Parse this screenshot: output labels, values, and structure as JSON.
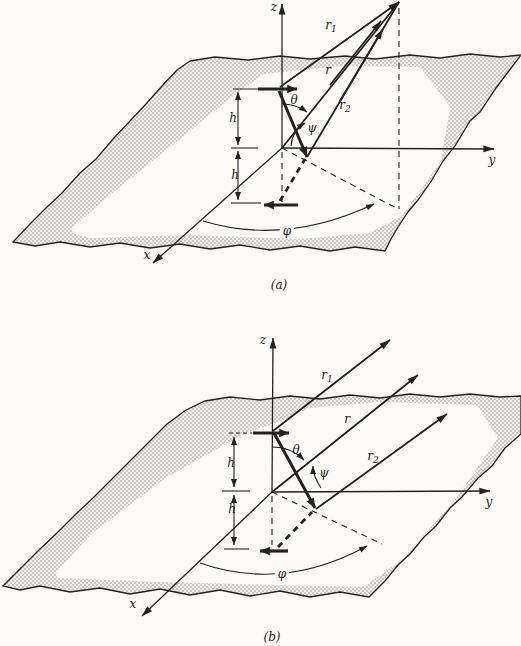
{
  "colors": {
    "ink": "#222222",
    "paper": "#fcfbf8",
    "stipple_bg": "#f1f0ec",
    "stipple_dot": "#9b9b97"
  },
  "panels": [
    {
      "caption": "(a)",
      "axes": {
        "x": "x",
        "y": "y",
        "z": "z"
      },
      "rays": {
        "r1": {
          "base": "r",
          "sub": "1"
        },
        "r": {
          "base": "r"
        },
        "r2": {
          "base": "r",
          "sub": "2"
        }
      },
      "angles": {
        "theta": "θ",
        "psi": "ψ",
        "phi": "φ"
      },
      "dimensions": {
        "upper": "h",
        "lower": "h"
      }
    },
    {
      "caption": "(b)",
      "axes": {
        "x": "x",
        "y": "y",
        "z": "z"
      },
      "rays": {
        "r1": {
          "base": "r",
          "sub": "1"
        },
        "r": {
          "base": "r"
        },
        "r2": {
          "base": "r",
          "sub": "2"
        }
      },
      "angles": {
        "theta": "θ",
        "psi": "ψ",
        "phi": "φ"
      },
      "dimensions": {
        "upper": "h",
        "lower": "h"
      }
    }
  ]
}
